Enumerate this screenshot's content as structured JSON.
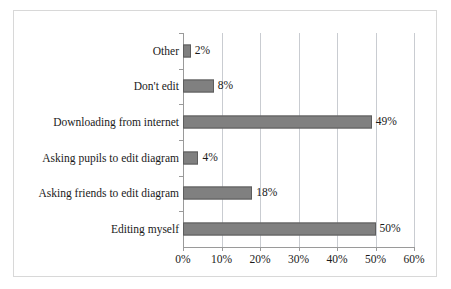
{
  "chart_data": {
    "type": "bar",
    "orientation": "horizontal",
    "title": "",
    "xlabel": "",
    "ylabel": "",
    "categories": [
      "Editing myself",
      "Asking friends to edit diagram",
      "Asking pupils to edit diagram",
      "Downloading from internet",
      "Don't edit",
      "Other"
    ],
    "values": [
      50,
      18,
      4,
      49,
      8,
      2
    ],
    "value_labels": [
      "50%",
      "18%",
      "4%",
      "49%",
      "8%",
      "2%"
    ],
    "xlim": [
      0,
      60
    ],
    "xticks": [
      0,
      10,
      20,
      30,
      40,
      50,
      60
    ],
    "xtick_labels": [
      "0%",
      "10%",
      "20%",
      "30%",
      "40%",
      "50%",
      "60%"
    ],
    "grid": true,
    "grid_axis": "x",
    "legend": false,
    "bar_color": "#808080",
    "bar_edge_color": "#5d5d5d",
    "grid_color": "#c9ccd1",
    "axis_color": "#9a9a9a",
    "frame_color": "#d8d8d8",
    "background": "#ffffff"
  }
}
